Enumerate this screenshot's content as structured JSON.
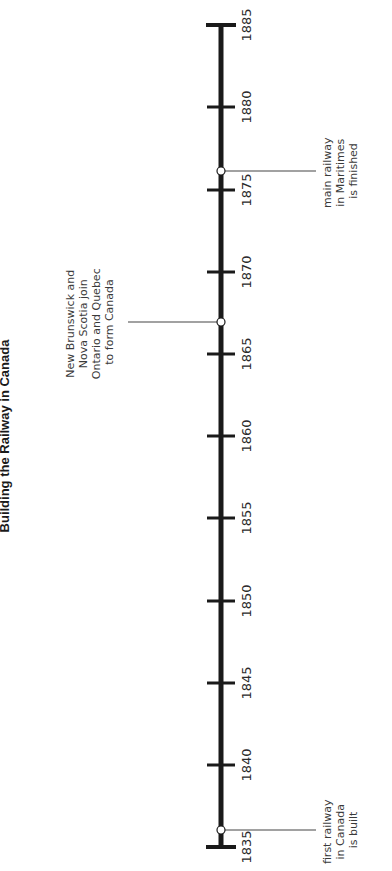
{
  "title": "Building the Railway in Canada",
  "timeline": {
    "start_year": 1835,
    "end_year": 1885,
    "tick_labels": [
      "1835",
      "1840",
      "1845",
      "1850",
      "1855",
      "1860",
      "1865",
      "1870",
      "1875",
      "1880",
      "1885"
    ],
    "events": [
      {
        "year": 1836,
        "lines": [
          "first railway",
          "in Canada",
          "is built"
        ]
      },
      {
        "year": 1867,
        "lines": [
          "New Brunswick and",
          "Nova Scotia join",
          "Ontario and Quebec",
          "to form Canada"
        ]
      },
      {
        "year": 1876,
        "lines": [
          "main railway",
          "in Maritimes",
          "is finished"
        ]
      }
    ]
  },
  "colors": {
    "axis": "#1a1a1a",
    "text": "#2b2b2b",
    "background": "#ffffff"
  }
}
